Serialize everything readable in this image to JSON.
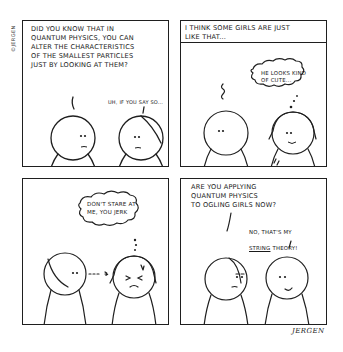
{
  "comic": {
    "copyright": "©JERGEN",
    "signature": "JERGEN",
    "panels": [
      {
        "id": 1,
        "speech_boy": "DID YOU KNOW THAT IN\nQUANTUM PHYSICS, YOU CAN\nALTER THE CHARACTERISTICS\nOF THE SMALLEST PARTICLES\nJUST BY LOOKING AT THEM?",
        "speech_girl": "UH, IF YOU SAY SO..."
      },
      {
        "id": 2,
        "caption": "I THINK SOME GIRLS ARE JUST\nLIKE THAT...",
        "thought_girl": "HE LOOKS KIND\nOF CUTE..."
      },
      {
        "id": 3,
        "thought_girl": "DON'T STARE AT\nME, YOU JERK"
      },
      {
        "id": 4,
        "speech_girl": "ARE YOU APPLYING\nQUANTUM PHYSICS\nTO OGLING GIRLS NOW?",
        "speech_boy_line1": "NO, THAT'S MY",
        "speech_boy_string": "STRING",
        "speech_boy_theory": " THEORY!"
      }
    ]
  },
  "colors": {
    "ink": "#1f1f1f",
    "paper": "#ffffff"
  }
}
